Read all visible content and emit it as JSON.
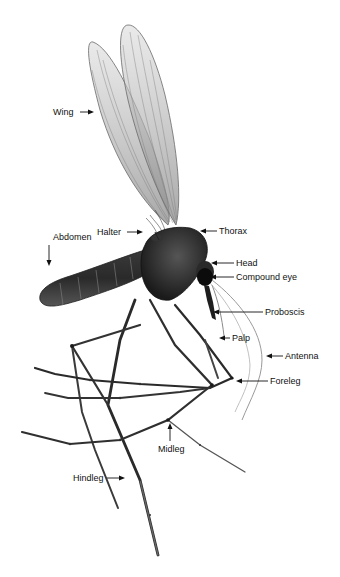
{
  "figure": {
    "background": "#ffffff",
    "ink_color": "#111111",
    "labels": [
      {
        "id": "wing",
        "text": "Wing",
        "x": 53,
        "y": 107,
        "arrow": "right"
      },
      {
        "id": "halter",
        "text": "Halter",
        "x": 97,
        "y": 227,
        "arrow": "right"
      },
      {
        "id": "thorax",
        "text": "Thorax",
        "x": 219,
        "y": 226,
        "arrow": "left"
      },
      {
        "id": "abdomen",
        "text": "Abdomen",
        "x": 53,
        "y": 232,
        "arrow": "down"
      },
      {
        "id": "head",
        "text": "Head",
        "x": 236,
        "y": 258,
        "arrow": "left"
      },
      {
        "id": "compound-eye",
        "text": "Compound eye",
        "x": 236,
        "y": 272,
        "arrow": "left"
      },
      {
        "id": "proboscis",
        "text": "Proboscis",
        "x": 265,
        "y": 307,
        "arrow": "left"
      },
      {
        "id": "palp",
        "text": "Palp",
        "x": 232,
        "y": 333,
        "arrow": "left"
      },
      {
        "id": "antenna",
        "text": "Antenna",
        "x": 285,
        "y": 351,
        "arrow": "left"
      },
      {
        "id": "foreleg",
        "text": "Foreleg",
        "x": 270,
        "y": 376,
        "arrow": "left"
      },
      {
        "id": "midleg",
        "text": "Midleg",
        "x": 158,
        "y": 444,
        "arrow": "up"
      },
      {
        "id": "hindleg",
        "text": "Hindleg",
        "x": 73,
        "y": 473,
        "arrow": "right"
      }
    ]
  }
}
